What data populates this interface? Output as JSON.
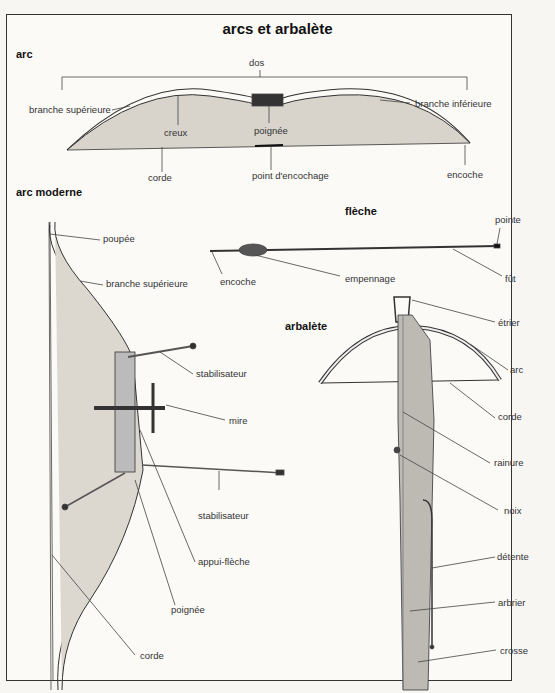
{
  "title": "arcs et arbalète",
  "sections": {
    "arc": {
      "heading": "arc",
      "labels": {
        "dos": "dos",
        "branche_superieure": "branche supérieure",
        "branche_inferieure": "branche inférieure",
        "creux": "creux",
        "poignee": "poignée",
        "corde": "corde",
        "point_encochage": "point d'encochage",
        "encoche": "encoche"
      }
    },
    "arc_moderne": {
      "heading": "arc moderne",
      "labels": {
        "poupee": "poupée",
        "branche_superieure": "branche supérieure",
        "stabilisateur_1": "stabilisateur",
        "mire": "mire",
        "stabilisateur_2": "stabilisateur",
        "appui_fleche": "appui-flèche",
        "poignee": "poignée",
        "corde": "corde"
      }
    },
    "fleche": {
      "heading": "flèche",
      "labels": {
        "pointe": "pointe",
        "encoche": "encoche",
        "empennage": "empennage",
        "fut": "fût"
      }
    },
    "arbalete": {
      "heading": "arbalète",
      "labels": {
        "etrier": "étrier",
        "arc": "arc",
        "corde": "corde",
        "rainure": "rainure",
        "noix": "noix",
        "detente": "détente",
        "arbrier": "arbrier",
        "crosse": "crosse"
      }
    }
  }
}
